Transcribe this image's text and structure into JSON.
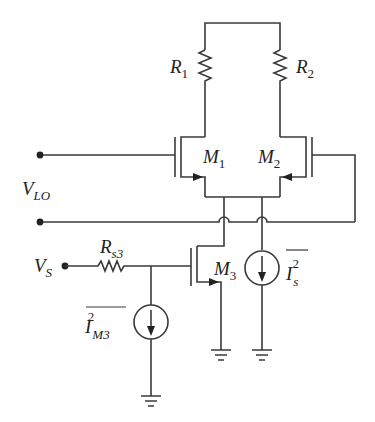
{
  "diagram": {
    "type": "circuit-schematic",
    "title": "",
    "labels": {
      "r1": {
        "main": "R",
        "sub": "1"
      },
      "r2": {
        "main": "R",
        "sub": "2"
      },
      "m1": {
        "main": "M",
        "sub": "1"
      },
      "m2": {
        "main": "M",
        "sub": "2"
      },
      "m3": {
        "main": "M",
        "sub": "3"
      },
      "vlo": {
        "main": "V",
        "sub": "LO"
      },
      "vs": {
        "main": "V",
        "sub": "S"
      },
      "rs3": {
        "main": "R",
        "sub": "s3"
      },
      "is_noise": {
        "main": "I",
        "sub": "s",
        "sup": "2"
      },
      "im3_noise": {
        "main": "I",
        "sub": "M3",
        "sup": "2"
      }
    },
    "components": [
      {
        "id": "R1",
        "kind": "resistor"
      },
      {
        "id": "R2",
        "kind": "resistor"
      },
      {
        "id": "M1",
        "kind": "nmos"
      },
      {
        "id": "M2",
        "kind": "nmos"
      },
      {
        "id": "M3",
        "kind": "nmos"
      },
      {
        "id": "Rs3",
        "kind": "resistor"
      },
      {
        "id": "Is",
        "kind": "noise-current-source"
      },
      {
        "id": "IM3",
        "kind": "noise-current-source"
      }
    ],
    "colors": {
      "line": "#3a3a3a",
      "text": "#222222",
      "background": "#ffffff"
    }
  }
}
